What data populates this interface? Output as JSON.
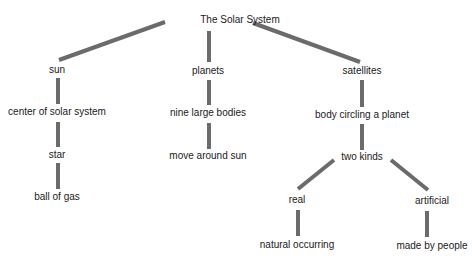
{
  "diagram": {
    "type": "concept-map",
    "link_color": "#6b6b6b",
    "nodes": [
      {
        "id": "root",
        "label": "The Solar System",
        "x": 240,
        "y": 20
      },
      {
        "id": "sun",
        "label": "sun",
        "x": 57,
        "y": 70
      },
      {
        "id": "planets",
        "label": "planets",
        "x": 208,
        "y": 71
      },
      {
        "id": "satellites",
        "label": "satellites",
        "x": 362,
        "y": 71
      },
      {
        "id": "center",
        "label": "center of solar system",
        "x": 57,
        "y": 112
      },
      {
        "id": "nine",
        "label": "nine large bodies",
        "x": 208,
        "y": 113
      },
      {
        "id": "body",
        "label": "body circling a planet",
        "x": 362,
        "y": 115
      },
      {
        "id": "star",
        "label": "star",
        "x": 57,
        "y": 155
      },
      {
        "id": "move",
        "label": "move around sun",
        "x": 208,
        "y": 156
      },
      {
        "id": "twokinds",
        "label": "two kinds",
        "x": 362,
        "y": 157
      },
      {
        "id": "ball",
        "label": "ball of gas",
        "x": 57,
        "y": 197
      },
      {
        "id": "real",
        "label": "real",
        "x": 297,
        "y": 200
      },
      {
        "id": "artificial",
        "label": "artificial",
        "x": 432,
        "y": 201
      },
      {
        "id": "natural",
        "label": "natural occurring",
        "x": 297,
        "y": 245
      },
      {
        "id": "people",
        "label": "made by people",
        "x": 432,
        "y": 246
      }
    ],
    "links": [
      {
        "from": "root",
        "to": "sun",
        "x1": 165,
        "y1": 22,
        "x2": 59,
        "y2": 60
      },
      {
        "from": "root",
        "to": "planets",
        "x1": 209,
        "y1": 31,
        "x2": 209,
        "y2": 62
      },
      {
        "from": "root",
        "to": "satellites",
        "x1": 253,
        "y1": 23,
        "x2": 360,
        "y2": 62
      },
      {
        "from": "sun",
        "to": "center",
        "x1": 58,
        "y1": 78,
        "x2": 58,
        "y2": 104
      },
      {
        "from": "center",
        "to": "star",
        "x1": 58,
        "y1": 122,
        "x2": 58,
        "y2": 147
      },
      {
        "from": "star",
        "to": "ball",
        "x1": 58,
        "y1": 163,
        "x2": 58,
        "y2": 189
      },
      {
        "from": "planets",
        "to": "nine",
        "x1": 209,
        "y1": 80,
        "x2": 209,
        "y2": 105
      },
      {
        "from": "nine",
        "to": "move",
        "x1": 209,
        "y1": 123,
        "x2": 209,
        "y2": 149
      },
      {
        "from": "satellites",
        "to": "body",
        "x1": 362,
        "y1": 80,
        "x2": 362,
        "y2": 107
      },
      {
        "from": "body",
        "to": "twokinds",
        "x1": 362,
        "y1": 124,
        "x2": 362,
        "y2": 150
      },
      {
        "from": "twokinds",
        "to": "real",
        "x1": 334,
        "y1": 160,
        "x2": 298,
        "y2": 189
      },
      {
        "from": "twokinds",
        "to": "artificial",
        "x1": 391,
        "y1": 160,
        "x2": 428,
        "y2": 190
      },
      {
        "from": "real",
        "to": "natural",
        "x1": 298,
        "y1": 210,
        "x2": 298,
        "y2": 236
      },
      {
        "from": "artificial",
        "to": "people",
        "x1": 427,
        "y1": 211,
        "x2": 427,
        "y2": 237
      }
    ]
  }
}
